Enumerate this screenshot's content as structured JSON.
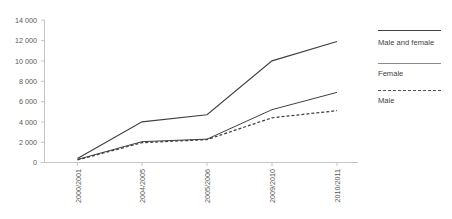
{
  "chart_data": {
    "type": "line",
    "title": "",
    "xlabel": "",
    "ylabel": "",
    "categories": [
      "2000/2001",
      "2004/2005",
      "2005/2006",
      "2009/2010",
      "2010/2011"
    ],
    "series": [
      {
        "name": "Male and female",
        "values": [
          400,
          4000,
          4700,
          10000,
          11900
        ],
        "style": "solid"
      },
      {
        "name": "Female",
        "values": [
          300,
          2050,
          2300,
          5200,
          6900
        ],
        "style": "solid"
      },
      {
        "name": "Male",
        "values": [
          250,
          1950,
          2250,
          4400,
          5100
        ],
        "style": "dashed"
      }
    ],
    "ylim": [
      0,
      14000
    ],
    "ytick_values": [
      0,
      2000,
      4000,
      6000,
      8000,
      10000,
      12000,
      14000
    ],
    "ytick_labels": [
      "0",
      "2 000",
      "4 000",
      "6 000",
      "8 000",
      "10 000",
      "12 000",
      "14 000"
    ],
    "grid": false,
    "legend_position": "right",
    "xtick_rotation": -90
  },
  "legend": {
    "entries": [
      {
        "label": "Male and female",
        "swatch": "solid-line-swatch"
      },
      {
        "label": "Female",
        "swatch": "solid-line-swatch"
      },
      {
        "label": "Male",
        "swatch": "dashed-line-swatch"
      }
    ]
  },
  "colors": {
    "series_line": "#404040",
    "axis": "#bfbfbf",
    "text": "#595959",
    "background": "#ffffff"
  }
}
